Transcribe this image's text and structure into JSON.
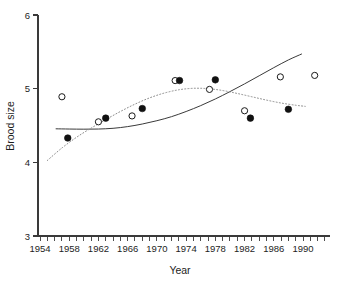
{
  "chart_data": {
    "type": "scatter",
    "title": "",
    "xlabel": "Year",
    "ylabel": "Brood size",
    "xlim": [
      1954,
      1993
    ],
    "ylim": [
      3,
      6
    ],
    "grid": false,
    "legend": "none",
    "x_ticks_major": [
      1954,
      1958,
      1962,
      1966,
      1970,
      1974,
      1978,
      1982,
      1986,
      1990
    ],
    "x_tick_labels": [
      "1954",
      "1958",
      "1962",
      "1966",
      "1970",
      "1974",
      "1978",
      "1982",
      "1986",
      "1990"
    ],
    "x_minor_tick_interval": 1,
    "y_ticks": [
      3,
      4,
      5,
      6
    ],
    "y_tick_labels": [
      "3",
      "4",
      "5",
      "6"
    ],
    "series": [
      {
        "name": "open-circles",
        "marker": "open-circle",
        "marker_fill": "#ffffff",
        "marker_stroke": "#1a1a1a",
        "points": [
          {
            "x": 1957.0,
            "y": 4.89
          },
          {
            "x": 1962.0,
            "y": 4.55
          },
          {
            "x": 1966.6,
            "y": 4.63
          },
          {
            "x": 1972.5,
            "y": 5.11
          },
          {
            "x": 1977.2,
            "y": 4.99
          },
          {
            "x": 1982.0,
            "y": 4.7
          },
          {
            "x": 1986.9,
            "y": 5.16
          },
          {
            "x": 1991.6,
            "y": 5.18
          }
        ]
      },
      {
        "name": "filled-circles",
        "marker": "filled-circle",
        "marker_fill": "#111111",
        "marker_stroke": "#111111",
        "points": [
          {
            "x": 1957.8,
            "y": 4.33
          },
          {
            "x": 1963.0,
            "y": 4.6
          },
          {
            "x": 1968.0,
            "y": 4.73
          },
          {
            "x": 1973.1,
            "y": 5.11
          },
          {
            "x": 1978.0,
            "y": 5.12
          },
          {
            "x": 1982.8,
            "y": 4.6
          },
          {
            "x": 1988.0,
            "y": 4.72
          }
        ]
      }
    ],
    "curves": [
      {
        "name": "solid-trend-curve",
        "style": "solid",
        "color": "#3a3a3a",
        "width": 1,
        "points": [
          {
            "x": 1956.2,
            "y": 4.455
          },
          {
            "x": 1958.0,
            "y": 4.452
          },
          {
            "x": 1960.0,
            "y": 4.45
          },
          {
            "x": 1962.0,
            "y": 4.452
          },
          {
            "x": 1964.0,
            "y": 4.462
          },
          {
            "x": 1966.0,
            "y": 4.485
          },
          {
            "x": 1968.0,
            "y": 4.52
          },
          {
            "x": 1970.0,
            "y": 4.565
          },
          {
            "x": 1972.0,
            "y": 4.62
          },
          {
            "x": 1974.0,
            "y": 4.69
          },
          {
            "x": 1976.0,
            "y": 4.77
          },
          {
            "x": 1978.0,
            "y": 4.86
          },
          {
            "x": 1980.0,
            "y": 4.96
          },
          {
            "x": 1982.0,
            "y": 5.065
          },
          {
            "x": 1984.0,
            "y": 5.175
          },
          {
            "x": 1986.0,
            "y": 5.285
          },
          {
            "x": 1988.0,
            "y": 5.39
          },
          {
            "x": 1989.8,
            "y": 5.47
          }
        ]
      },
      {
        "name": "dotted-trend-curve",
        "style": "dotted",
        "color": "#8c8c8c",
        "width": 1,
        "points": [
          {
            "x": 1955.0,
            "y": 4.025
          },
          {
            "x": 1957.0,
            "y": 4.195
          },
          {
            "x": 1959.0,
            "y": 4.34
          },
          {
            "x": 1961.0,
            "y": 4.465
          },
          {
            "x": 1963.0,
            "y": 4.58
          },
          {
            "x": 1965.0,
            "y": 4.69
          },
          {
            "x": 1967.0,
            "y": 4.79
          },
          {
            "x": 1969.0,
            "y": 4.875
          },
          {
            "x": 1971.0,
            "y": 4.94
          },
          {
            "x": 1973.0,
            "y": 4.985
          },
          {
            "x": 1975.0,
            "y": 5.005
          },
          {
            "x": 1977.0,
            "y": 5.0
          },
          {
            "x": 1979.0,
            "y": 4.975
          },
          {
            "x": 1981.0,
            "y": 4.935
          },
          {
            "x": 1983.0,
            "y": 4.89
          },
          {
            "x": 1985.0,
            "y": 4.845
          },
          {
            "x": 1987.0,
            "y": 4.805
          },
          {
            "x": 1989.0,
            "y": 4.775
          },
          {
            "x": 1990.3,
            "y": 4.76
          }
        ]
      }
    ]
  },
  "axes": {
    "y_title": "Brood size",
    "x_title": "Year"
  },
  "colors": {
    "axis": "#3a3a3a",
    "text": "#1d1d1d",
    "solid_curve": "#3a3a3a",
    "dotted_curve": "#8c8c8c",
    "filled_marker": "#111111",
    "open_marker_stroke": "#1a1a1a",
    "background": "#ffffff"
  }
}
